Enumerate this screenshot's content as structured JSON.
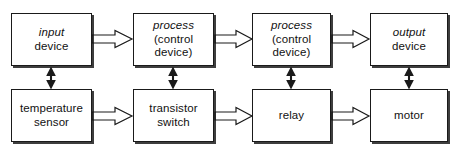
{
  "diagram": {
    "type": "block-diagram",
    "background_color": "#ffffff",
    "line_color": "#1a1a1a",
    "text_color": "#111111",
    "rows": [
      {
        "name": "generic-row",
        "nodes": [
          {
            "id": "input-device",
            "lines": [
              {
                "text": "input",
                "style": "italic"
              },
              {
                "text": "device",
                "style": "normal"
              }
            ]
          },
          {
            "id": "process-control-device-1",
            "lines": [
              {
                "text": "process",
                "style": "italic"
              },
              {
                "text": "(control",
                "style": "normal"
              },
              {
                "text": "device)",
                "style": "normal"
              }
            ]
          },
          {
            "id": "process-control-device-2",
            "lines": [
              {
                "text": "process",
                "style": "italic"
              },
              {
                "text": "(control",
                "style": "normal"
              },
              {
                "text": "device)",
                "style": "normal"
              }
            ]
          },
          {
            "id": "output-device",
            "lines": [
              {
                "text": "output",
                "style": "italic"
              },
              {
                "text": "device",
                "style": "normal"
              }
            ]
          }
        ]
      },
      {
        "name": "example-row",
        "nodes": [
          {
            "id": "temperature-sensor",
            "lines": [
              {
                "text": "temperature",
                "style": "normal"
              },
              {
                "text": "sensor",
                "style": "normal"
              }
            ]
          },
          {
            "id": "transistor-switch",
            "lines": [
              {
                "text": "transistor",
                "style": "normal"
              },
              {
                "text": "switch",
                "style": "normal"
              }
            ]
          },
          {
            "id": "relay",
            "lines": [
              {
                "text": "relay",
                "style": "normal"
              }
            ]
          },
          {
            "id": "motor",
            "lines": [
              {
                "text": "motor",
                "style": "normal"
              }
            ]
          }
        ]
      }
    ],
    "connectors": {
      "horizontal": [
        {
          "from": "input-device",
          "to": "process-control-device-1",
          "style": "block-arrow",
          "direction": "right"
        },
        {
          "from": "process-control-device-1",
          "to": "process-control-device-2",
          "style": "block-arrow",
          "direction": "right"
        },
        {
          "from": "process-control-device-2",
          "to": "output-device",
          "style": "block-arrow",
          "direction": "right"
        },
        {
          "from": "temperature-sensor",
          "to": "transistor-switch",
          "style": "block-arrow",
          "direction": "right"
        },
        {
          "from": "transistor-switch",
          "to": "relay",
          "style": "block-arrow",
          "direction": "right"
        },
        {
          "from": "relay",
          "to": "motor",
          "style": "block-arrow",
          "direction": "right"
        }
      ],
      "vertical": [
        {
          "from": "input-device",
          "to": "temperature-sensor",
          "style": "double-arrow",
          "direction": "both"
        },
        {
          "from": "process-control-device-1",
          "to": "transistor-switch",
          "style": "double-arrow",
          "direction": "both"
        },
        {
          "from": "process-control-device-2",
          "to": "relay",
          "style": "double-arrow",
          "direction": "both"
        },
        {
          "from": "output-device",
          "to": "motor",
          "style": "double-arrow",
          "direction": "both"
        }
      ]
    }
  }
}
